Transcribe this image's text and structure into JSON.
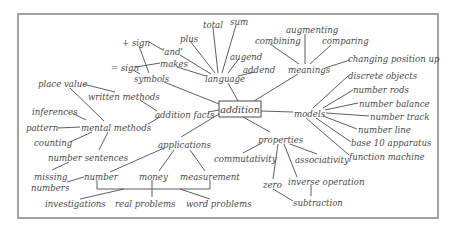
{
  "diagram": {
    "type": "concept-map",
    "center": {
      "label": "addition",
      "x": 240,
      "y": 109
    },
    "branches": [
      {
        "label": "language",
        "children": [
          "total",
          "sum",
          "plus",
          "'and'",
          "augend",
          "addend",
          "makes"
        ]
      },
      {
        "label": "symbols",
        "children": [
          "+ sign",
          "= sign"
        ]
      },
      {
        "label": "meanings",
        "children": [
          "combining",
          "augmenting",
          "comparing",
          "changing position up"
        ]
      },
      {
        "label": "models",
        "children": [
          "discrete objects",
          "number rods",
          "number balance",
          "number track",
          "number line",
          "base 10 apparatus",
          "function machine"
        ]
      },
      {
        "label": "properties",
        "children": [
          "commutativity",
          "associativity",
          "zero",
          "inverse operation"
        ]
      },
      {
        "label": "applications",
        "children": [
          "number",
          "money",
          "measurement"
        ]
      },
      {
        "label": "addition facts",
        "children": [
          "written methods",
          "mental methods"
        ]
      }
    ],
    "nodes": {
      "addition": "addition",
      "language": "language",
      "total": "total",
      "sum": "sum",
      "plus": "plus",
      "and": "'and'",
      "augend": "augend",
      "addend": "addend",
      "makes": "makes",
      "plus_sign": "+ sign",
      "equals_sign": "= sign",
      "symbols": "symbols",
      "meanings": "meanings",
      "combining": "combining",
      "augmenting": "augmenting",
      "comparing": "comparing",
      "changing": "changing position up",
      "models": "models",
      "discrete": "discrete objects",
      "rods": "number rods",
      "balance": "number balance",
      "track": "number track",
      "line": "number line",
      "base10": "base 10 apparatus",
      "function": "function machine",
      "properties": "properties",
      "commutativity": "commutativity",
      "associativity": "associativity",
      "zero": "zero",
      "inverse": "inverse operation",
      "subtraction": "subtraction",
      "applications": "applications",
      "number": "number",
      "money": "money",
      "measurement": "measurement",
      "investigations": "investigations",
      "real_problems": "real problems",
      "word_problems": "word problems",
      "addition_facts": "addition facts",
      "written_methods": "written methods",
      "place_value": "place value",
      "mental_methods": "mental methods",
      "inferences": "inferences",
      "pattern": "pattern",
      "counting": "counting",
      "number_sentences": "number sentences",
      "missing_1": "missing",
      "missing_2": "numbers"
    },
    "colors": {
      "text": "#4a4a4a",
      "lines": "#4d4d4d",
      "frame": "#8a8a8a",
      "background": "#ffffff"
    }
  }
}
